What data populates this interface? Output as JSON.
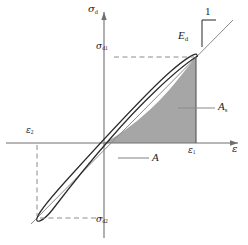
{
  "figure": {
    "type": "diagram",
    "background_color": "#ffffff",
    "shade_color": "#a6a6a6",
    "curve_color": "#1a1a1a",
    "axis_color": "#666666",
    "dash_color": "#8c8c8c"
  },
  "axes": {
    "y_axis_label": "σ",
    "y_axis_sub": "d",
    "x_axis_label": "ε",
    "origin_x": 104,
    "origin_y": 143
  },
  "labels": {
    "sigma_d": {
      "base": "σ",
      "sub": "d"
    },
    "sigma_d1": {
      "base": "σ",
      "sub": "d1"
    },
    "sigma_d2": {
      "base": "σ",
      "sub": "d2"
    },
    "epsilon": {
      "base": "ε",
      "sub": ""
    },
    "epsilon_1": {
      "base": "ε",
      "sub": "1"
    },
    "epsilon_2": {
      "base": "ε",
      "sub": "2"
    },
    "modulus": {
      "base": "E",
      "sub": "d"
    },
    "slope_unit": "1",
    "area_loop": "A",
    "area_shaded": {
      "base": "A",
      "sub": "s"
    }
  },
  "geometry": {
    "loop_tip_upper_right": [
      196,
      57
    ],
    "loop_tip_lower_left": [
      37,
      218
    ],
    "sigma_d1_level_y": 57,
    "sigma_d2_level_y": 218,
    "epsilon_1_x": 196,
    "epsilon_2_x": 37,
    "secant_slope_note": "E_d is slope of line joining loop tips"
  }
}
